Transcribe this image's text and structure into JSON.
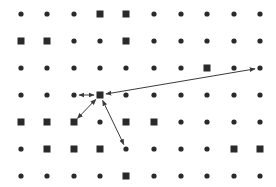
{
  "diagram": {
    "colors": {
      "node": "#2a2a2a",
      "arrow": "#3a3a3a",
      "background": "#ffffff"
    },
    "columns_x": [
      21,
      47,
      74,
      100,
      126,
      154,
      181,
      207,
      234,
      260
    ],
    "rows_y": [
      14,
      41,
      68,
      95,
      122,
      149,
      176
    ],
    "legend": {
      "o": "circle",
      "s": "square"
    },
    "grid": [
      [
        "o",
        "o",
        "o",
        "s",
        "s",
        "o",
        "o",
        "o",
        "o",
        "o"
      ],
      [
        "s",
        "s",
        "o",
        "o",
        "s",
        "o",
        "o",
        "o",
        "o",
        "o"
      ],
      [
        "o",
        "o",
        "o",
        "o",
        "o",
        "o",
        "o",
        "s",
        "o",
        "o"
      ],
      [
        "o",
        "o",
        "o",
        "s",
        "o",
        "o",
        "o",
        "o",
        "o",
        "o"
      ],
      [
        "s",
        "s",
        "s",
        "o",
        "s",
        "s",
        "o",
        "o",
        "o",
        "o"
      ],
      [
        "o",
        "s",
        "s",
        "s",
        "o",
        "o",
        "o",
        "o",
        "s",
        "s"
      ],
      [
        "o",
        "o",
        "o",
        "o",
        "s",
        "o",
        "o",
        "o",
        "o",
        "o"
      ]
    ],
    "center": {
      "col": 3,
      "row": 3
    },
    "arrows": [
      {
        "from": {
          "col": 3,
          "row": 3
        },
        "to": {
          "col": 2,
          "row": 3
        },
        "heads": "both"
      },
      {
        "from": {
          "col": 3,
          "row": 3
        },
        "to": {
          "col": 9,
          "row": 2
        },
        "heads": "both"
      },
      {
        "from": {
          "col": 3,
          "row": 3
        },
        "to": {
          "col": 2,
          "row": 4
        },
        "heads": "both"
      },
      {
        "from": {
          "col": 3,
          "row": 3
        },
        "to": {
          "col": 4,
          "row": 5
        },
        "heads": "both"
      }
    ]
  }
}
